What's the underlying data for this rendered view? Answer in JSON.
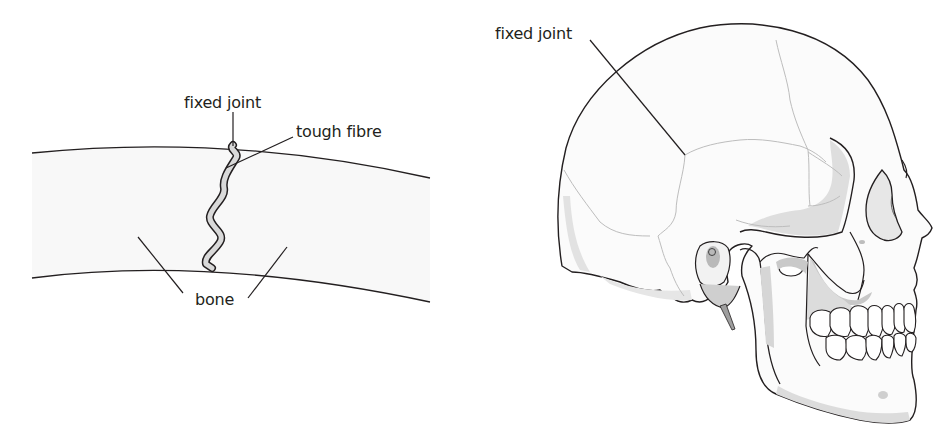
{
  "figure": {
    "left_panel": {
      "title": "Fixed joint between two bones",
      "labels": {
        "fixed_joint": "fixed joint",
        "tough_fibre": "tough fibre",
        "bone": "bone"
      }
    },
    "right_panel": {
      "title": "Skull side view",
      "labels": {
        "fixed_joint": "fixed joint"
      }
    },
    "colors": {
      "outline": "#231f20",
      "bone_fill": "#f8f8f8",
      "fibre_fill": "#d9d9d9",
      "shade_light": "#e2e2e2",
      "shade_mid": "#cfcfcf",
      "shade_dark": "#b5b5b5",
      "suture": "#bdbdbd"
    }
  }
}
